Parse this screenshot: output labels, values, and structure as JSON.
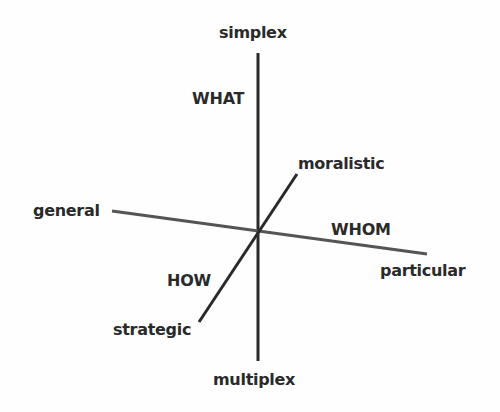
{
  "diagram": {
    "type": "three-axis-diagram",
    "colors": {
      "line": "#2a2a2a",
      "line_horizontal": "#555555",
      "text": "#2a2a2a",
      "background": "#fefefe"
    },
    "axes": {
      "vertical": {
        "top_label": "simplex",
        "bottom_label": "multiplex",
        "dimension_label": "WHAT"
      },
      "horizontal": {
        "left_label": "general",
        "right_label": "particular",
        "dimension_label": "WHOM"
      },
      "diagonal": {
        "top_label": "moralistic",
        "bottom_label": "strategic",
        "dimension_label": "HOW"
      }
    }
  }
}
